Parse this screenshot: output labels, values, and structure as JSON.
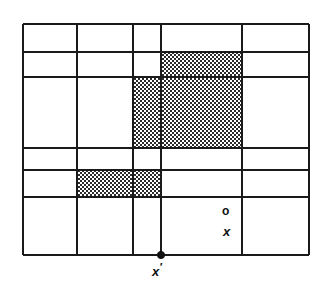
{
  "figure": {
    "background_color": "#ffffff",
    "line_color": "#1a1a1a",
    "shade_color": "#8c8c8c",
    "grid": {
      "x_lines": [
        23,
        77,
        133,
        161,
        242,
        309
      ],
      "y_lines": [
        24,
        52,
        77,
        148,
        170,
        197,
        255
      ],
      "left": 23,
      "right": 309,
      "top": 24,
      "bottom": 255,
      "line_width": 2
    },
    "shaded_cells": [
      {
        "name": "shaded-cell-upper",
        "x": 161,
        "y": 52,
        "width": 81,
        "height": 25
      },
      {
        "name": "shaded-cell-middle",
        "x": 133,
        "y": 77,
        "width": 109,
        "height": 71
      },
      {
        "name": "shaded-cell-lower-left",
        "x": 77,
        "y": 170,
        "width": 84,
        "height": 27
      }
    ],
    "markers": [
      {
        "name": "marker-o",
        "label": "o",
        "x": 228,
        "y": 212,
        "style": "open-circle"
      },
      {
        "name": "marker-x",
        "label": "x",
        "x": 228,
        "y": 232,
        "style": "cross"
      },
      {
        "name": "marker-xprime",
        "label": "x",
        "prime": "′",
        "x": 161,
        "y": 255,
        "style": "filled-dot"
      }
    ]
  }
}
